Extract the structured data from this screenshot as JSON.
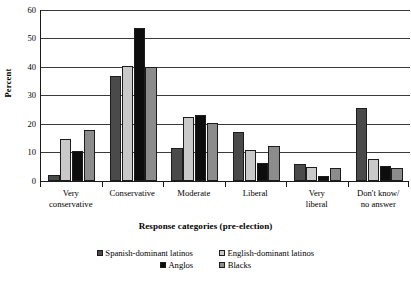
{
  "chart_data": {
    "type": "bar",
    "title": "",
    "xlabel": "Response categories (pre-election)",
    "ylabel": "Percent",
    "ylim": [
      0,
      60
    ],
    "ytick_values": [
      0,
      10,
      20,
      30,
      40,
      50,
      60
    ],
    "ytick_labels": [
      "0",
      "10",
      "20",
      "30",
      "40",
      "50",
      "60"
    ],
    "grid": true,
    "grid_axis": "y",
    "legend_position": "bottom",
    "categories": [
      "Very conservative",
      "Conservative",
      "Moderate",
      "Liberal",
      "Very liberal",
      "Don't know/no answer"
    ],
    "category_label_lines": [
      [
        "Very",
        "conservative"
      ],
      [
        "Conservative",
        ""
      ],
      [
        "Moderate",
        ""
      ],
      [
        "Liberal",
        ""
      ],
      [
        "Very",
        "liberal"
      ],
      [
        "Don't know/",
        "no answer"
      ]
    ],
    "series": [
      {
        "name": "Spanish-dominant latinos",
        "color": "#4a4a4a",
        "values": [
          2.0,
          36.8,
          11.4,
          17.1,
          6.0,
          25.6
        ]
      },
      {
        "name": "English-dominant latinos",
        "color": "#c9c9c9",
        "values": [
          14.7,
          40.4,
          22.4,
          10.9,
          4.8,
          7.6
        ]
      },
      {
        "name": "Anglos",
        "color": "#0d0d0d",
        "values": [
          10.3,
          53.7,
          23.1,
          6.1,
          1.5,
          5.3
        ]
      },
      {
        "name": "Blacks",
        "color": "#8c8c8c",
        "values": [
          17.7,
          40.0,
          20.2,
          12.3,
          4.4,
          4.6
        ]
      }
    ]
  },
  "axes": {
    "y_title": "Percent",
    "x_title": "Response categories (pre-election)"
  },
  "legend": {
    "rows": [
      [
        "Spanish-dominant latinos",
        "English-dominant latinos"
      ],
      [
        "Anglos",
        "Blacks"
      ]
    ]
  },
  "colors": {
    "axis": "#1a1a1a",
    "grid": "#3a3a3a",
    "bar_outline": "#1c1c1c",
    "background": "#ffffff"
  }
}
